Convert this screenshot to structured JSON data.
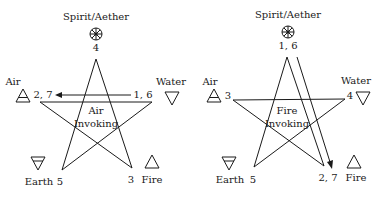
{
  "diagrams": [
    {
      "title_lines": [
        "Air",
        "Invoking"
      ],
      "elements": {
        "spirit": "Spirit/Aether",
        "air": "Air",
        "water": "Water",
        "earth": "Earth",
        "fire": "Fire"
      },
      "vertex_numbers": {
        "top": "4",
        "left": "2, 7",
        "right": "1, 6",
        "bottom_left": "5",
        "bottom_right": "3"
      },
      "arrow": {
        "from": "1, 6",
        "to": "2, 7"
      }
    },
    {
      "title_lines": [
        "Fire",
        "Invoking"
      ],
      "elements": {
        "spirit": "Spirit/Aether",
        "air": "Air",
        "water": "Water",
        "earth": "Earth",
        "fire": "Fire"
      },
      "vertex_numbers": {
        "top": "1, 6",
        "left": "3",
        "right": "4",
        "bottom_left": "5",
        "bottom_right": "2, 7"
      },
      "arrow": {
        "from": "1, 6",
        "to": "2, 7"
      }
    }
  ]
}
